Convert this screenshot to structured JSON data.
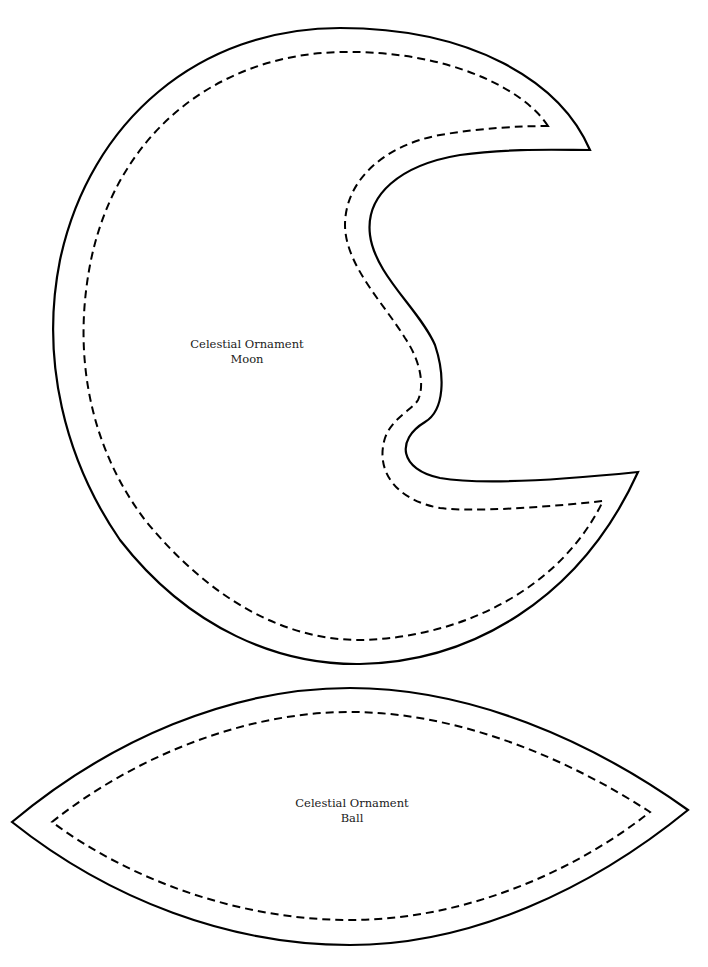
{
  "page": {
    "background": "#ffffff",
    "line_color": "#000000"
  },
  "pieces": [
    {
      "id": "moon",
      "title": "Celestial Ornament",
      "subtitle": "Moon",
      "outline": "solid cut line",
      "inner_outline": "dashed sewing line"
    },
    {
      "id": "ball",
      "title": "Celestial Ornament",
      "subtitle": "Ball",
      "outline": "solid cut line",
      "inner_outline": "dashed sewing line"
    }
  ]
}
